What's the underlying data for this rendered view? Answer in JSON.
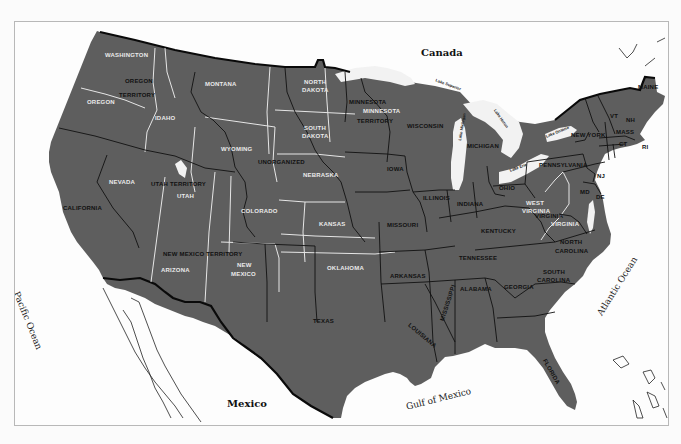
{
  "map": {
    "colors": {
      "land": "#5e5e5e",
      "water": "#fdfdfd",
      "territory_border": "#e8e8e8",
      "state_border": "#111111",
      "frame": "#b8b8b8"
    },
    "geographic_labels": {
      "canada": "Canada",
      "mexico": "Mexico",
      "pacific": "Pacific Ocean",
      "atlantic": "Atlantic Ocean",
      "gulf": "Gulf of Mexico"
    },
    "lakes": {
      "superior": "Lake Superior",
      "michigan": "Lake Michigan",
      "huron": "Lake Huron",
      "ontario": "Lake Ontario",
      "erie": "Lake Erie"
    },
    "territories": {
      "oregon_territory_1": "OREGON",
      "oregon_territory_2": "TERRITORY",
      "minnesota_territory_1": "MINNESOTA",
      "minnesota_territory_2": "TERRITORY",
      "utah_territory": "UTAH TERRITORY",
      "new_mexico_territory": "NEW MEXICO TERRITORY",
      "unorganized": "UNORGANIZED"
    },
    "modern_states_light": {
      "washington": "WASHINGTON",
      "oregon": "OREGON",
      "idaho": "IDAHO",
      "montana": "MONTANA",
      "wyoming": "WYOMING",
      "nevada": "NEVADA",
      "utah": "UTAH",
      "colorado": "COLORADO",
      "arizona": "ARIZONA",
      "new_mexico_1": "NEW",
      "new_mexico_2": "MEXICO",
      "north_dakota_1": "NORTH",
      "north_dakota_2": "DAKOTA",
      "south_dakota_1": "SOUTH",
      "south_dakota_2": "DAKOTA",
      "nebraska": "NEBRASKA",
      "kansas": "KANSAS",
      "oklahoma": "OKLAHOMA",
      "minnesota": "MINNESOTA",
      "west_virginia_1": "WEST",
      "west_virginia_2": "VIRGINIA",
      "virginia": "VIRGINIA"
    },
    "states": {
      "california": "CALIFORNIA",
      "texas": "TEXAS",
      "iowa": "IOWA",
      "missouri": "MISSOURI",
      "arkansas": "ARKANSAS",
      "louisiana": "LOUISIANA",
      "wisconsin": "WISCONSIN",
      "illinois": "ILLINOIS",
      "michigan": "MICHIGAN",
      "indiana": "INDIANA",
      "ohio": "OHIO",
      "kentucky": "KENTUCKY",
      "tennessee": "TENNESSEE",
      "mississippi": "MISSISSIPPI",
      "alabama": "ALABAMA",
      "georgia": "GEORGIA",
      "florida": "FLORIDA",
      "south_carolina_1": "SOUTH",
      "south_carolina_2": "CAROLINA",
      "north_carolina_1": "NORTH",
      "north_carolina_2": "CAROLINA",
      "virginia": "VIRGINIA",
      "pennsylvania": "PENNSYLVANIA",
      "new_york": "NEW YORK",
      "maine": "MAINE",
      "vermont": "VT",
      "new_hampshire": "NH",
      "massachusetts": "MASS",
      "connecticut": "CT",
      "rhode_island": "RI",
      "new_jersey": "NJ",
      "maryland": "MD",
      "delaware": "DE"
    }
  }
}
